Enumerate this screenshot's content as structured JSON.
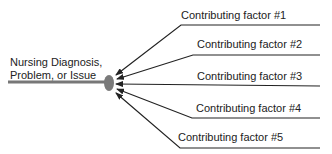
{
  "diagram": {
    "type": "fishbone-contributing-factors",
    "central_label_line1": "Nursing Diagnosis,",
    "central_label_line2": "Problem, or Issue",
    "factors": [
      {
        "label": "Contributing factor #1"
      },
      {
        "label": "Contributing factor #2"
      },
      {
        "label": "Contributing factor #3"
      },
      {
        "label": "Contributing factor #4"
      },
      {
        "label": "Contributing factor #5"
      }
    ],
    "colors": {
      "main_line": "#777777",
      "node": "#7a7a7a",
      "factor_lines": "#222222"
    }
  }
}
